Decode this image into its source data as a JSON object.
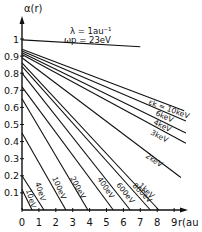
{
  "chart_data": {
    "type": "line",
    "title": "",
    "xlabel": "r(au)",
    "ylabel": "α(r)",
    "xlim": [
      0,
      9.5
    ],
    "ylim": [
      0,
      1.05
    ],
    "grid": false,
    "x_ticks": [
      "0",
      "1",
      "2",
      "3",
      "4",
      "5",
      "6",
      "7",
      "8",
      "9"
    ],
    "y_ticks": [
      "0.1",
      "0.2",
      "0.3",
      "0.4",
      "0.5",
      "0.6",
      "0.7",
      "0.8",
      "0.9",
      "1"
    ],
    "annotations": [
      "λ = 1au⁻¹",
      "ωp = 23eV"
    ],
    "series": [
      {
        "name": "top",
        "label": "",
        "points": [
          [
            0,
            0.995
          ],
          [
            7.0,
            0.955
          ]
        ]
      },
      {
        "name": "10keV",
        "label": "εk = 10keV",
        "points": [
          [
            0,
            0.94
          ],
          [
            9.6,
            0.58
          ]
        ]
      },
      {
        "name": "6keV",
        "label": "6keV",
        "points": [
          [
            0,
            0.93
          ],
          [
            9.7,
            0.52
          ]
        ]
      },
      {
        "name": "4keV",
        "label": "4keV",
        "points": [
          [
            0,
            0.92
          ],
          [
            9.7,
            0.45
          ]
        ]
      },
      {
        "name": "3keV",
        "label": "3keV",
        "points": [
          [
            0,
            0.91
          ],
          [
            9.7,
            0.39
          ]
        ]
      },
      {
        "name": "2keV",
        "label": "2keV",
        "points": [
          [
            0,
            0.89
          ],
          [
            9.4,
            0.19
          ]
        ]
      },
      {
        "name": "1keV",
        "label": "1keV",
        "points": [
          [
            0,
            0.86
          ],
          [
            8.1,
            0
          ]
        ]
      },
      {
        "name": "800eV",
        "label": "800eV",
        "points": [
          [
            0,
            0.84
          ],
          [
            7.6,
            0
          ]
        ]
      },
      {
        "name": "600eV",
        "label": "600eV",
        "points": [
          [
            0,
            0.8
          ],
          [
            6.4,
            0
          ]
        ]
      },
      {
        "name": "400eV",
        "label": "400eV",
        "points": [
          [
            0,
            0.72
          ],
          [
            5.4,
            0
          ]
        ]
      },
      {
        "name": "200eV",
        "label": "200eV",
        "points": [
          [
            0,
            0.65
          ],
          [
            3.9,
            0
          ]
        ]
      },
      {
        "name": "100eV",
        "label": "100eV",
        "points": [
          [
            0,
            0.45
          ],
          [
            2.6,
            0
          ]
        ]
      },
      {
        "name": "40eV",
        "label": "40eV",
        "points": [
          [
            0,
            0.2
          ],
          [
            1.3,
            0
          ]
        ]
      },
      {
        "name": "10eV",
        "label": "10eV",
        "points": [
          [
            0,
            0.12
          ],
          [
            0.6,
            0
          ]
        ]
      }
    ]
  },
  "labels": {
    "ylabel": "α(r)",
    "xlabel": "r(au",
    "lambda": "λ = 1au⁻¹",
    "omega": "ωp = 23eV",
    "l10k": "εk = 10keV",
    "l6k": "6keV",
    "l4k": "4keV",
    "l3k": "3keV",
    "l2k": "2keV",
    "l1k": "1keV",
    "l800": "800eV",
    "l600": "600eV",
    "l400": "400eV",
    "l200": "200eV",
    "l100": "100eV",
    "l40": "40eV",
    "l10": "10eV"
  }
}
